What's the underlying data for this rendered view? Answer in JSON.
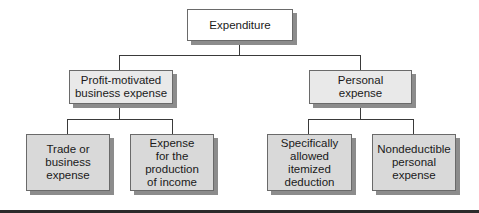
{
  "diagram": {
    "type": "tree",
    "root": {
      "label": "Expenditure"
    },
    "level2": [
      {
        "label": "Profit-motivated\nbusiness expense"
      },
      {
        "label": "Personal\nexpense"
      }
    ],
    "level3": [
      {
        "label": "Trade or\nbusiness\nexpense",
        "parent": "Profit-motivated business expense"
      },
      {
        "label": "Expense\nfor the\nproduction\nof income",
        "parent": "Profit-motivated business expense"
      },
      {
        "label": "Specifically\nallowed\nitemized\ndeduction",
        "parent": "Personal expense"
      },
      {
        "label": "Nondeductible\npersonal\nexpense",
        "parent": "Personal expense"
      }
    ]
  }
}
